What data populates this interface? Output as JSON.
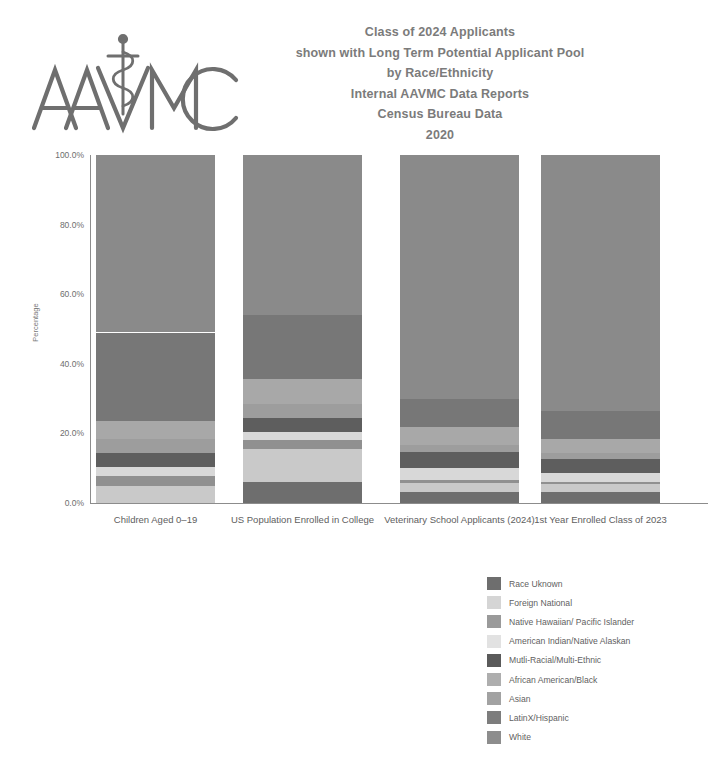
{
  "logo": {
    "name": "AAVMC",
    "alt_text": "AAVMC logo with caduceus"
  },
  "title": {
    "lines": [
      "Class of 2024 Applicants",
      "shown with Long Term Potential Applicant Pool",
      "by Race/Ethnicity",
      "Internal AAVMC Data Reports",
      "Census Bureau Data",
      "2020"
    ]
  },
  "chart_data": {
    "type": "bar",
    "subtype": "stacked-100-percent",
    "title": "Class of 2024 Applicants shown with Long Term Potential Applicant Pool by Race/Ethnicity",
    "xlabel": "",
    "ylabel": "Percentage",
    "ylim": [
      0,
      100
    ],
    "yticks": [
      "0.0%",
      "20.0%",
      "40.0%",
      "60.0%",
      "80.0%",
      "100.0%"
    ],
    "ytick_values": [
      0,
      20,
      40,
      60,
      80,
      100
    ],
    "grid": false,
    "legend_position": "below-right",
    "categories": [
      "Children Aged 0–19",
      "US Population Enrolled in College",
      "Veterinary School Applicants (2024)",
      "1st Year Enrolled Class of 2023"
    ],
    "series": [
      {
        "name": "White",
        "color": "#8a8a8a",
        "values": [
          51.0,
          46.0,
          70.0,
          73.5
        ]
      },
      {
        "name": "LatinX/Hispanic",
        "color": "#777777",
        "values": [
          25.5,
          18.5,
          8.2,
          8.0
        ]
      },
      {
        "name": "Asian",
        "color": "#a8a8a8",
        "values": [
          5.0,
          7.0,
          5.2,
          4.2
        ]
      },
      {
        "name": "African American/Black",
        "color": "#9d9d9d",
        "values": [
          4.2,
          4.0,
          2.0,
          1.6
        ]
      },
      {
        "name": "Mutli-Racial/Multi-Ethnic",
        "color": "#5e5e5e",
        "values": [
          4.0,
          4.0,
          4.6,
          4.0
        ]
      },
      {
        "name": "American Indian/Native Alaskan",
        "color": "#d8d8d8",
        "values": [
          2.5,
          2.5,
          3.4,
          2.6
        ]
      },
      {
        "name": "Native Hawaiian/ Pacific Islander",
        "color": "#909090",
        "values": [
          3.0,
          2.5,
          0.8,
          0.7
        ]
      },
      {
        "name": "Foreign National",
        "color": "#c9c9c9",
        "values": [
          4.8,
          9.5,
          2.6,
          2.2
        ]
      },
      {
        "name": "Race Uknown",
        "color": "#6e6e6e",
        "values": [
          0.0,
          6.0,
          3.2,
          3.2
        ]
      }
    ],
    "legend_order": [
      "Race Uknown",
      "Foreign National",
      "Native Hawaiian/ Pacific Islander",
      "American Indian/Native Alaskan",
      "Mutli-Racial/Multi-Ethnic",
      "African American/Black",
      "Asian",
      "LatinX/Hispanic",
      "White"
    ]
  },
  "legend": {
    "items": [
      {
        "label": "Race Uknown",
        "color": "#6e6e6e"
      },
      {
        "label": "Foreign National",
        "color": "#d5d5d5"
      },
      {
        "label": "Native Hawaiian/ Pacific Islander",
        "color": "#9a9a9a"
      },
      {
        "label": "American Indian/Native Alaskan",
        "color": "#e2e2e2"
      },
      {
        "label": "Mutli-Racial/Multi-Ethnic",
        "color": "#5a5a5a"
      },
      {
        "label": "African American/Black",
        "color": "#aeaeae"
      },
      {
        "label": "Asian",
        "color": "#a2a2a2"
      },
      {
        "label": "LatinX/Hispanic",
        "color": "#7d7d7d"
      },
      {
        "label": "White",
        "color": "#8d8d8d"
      }
    ]
  }
}
